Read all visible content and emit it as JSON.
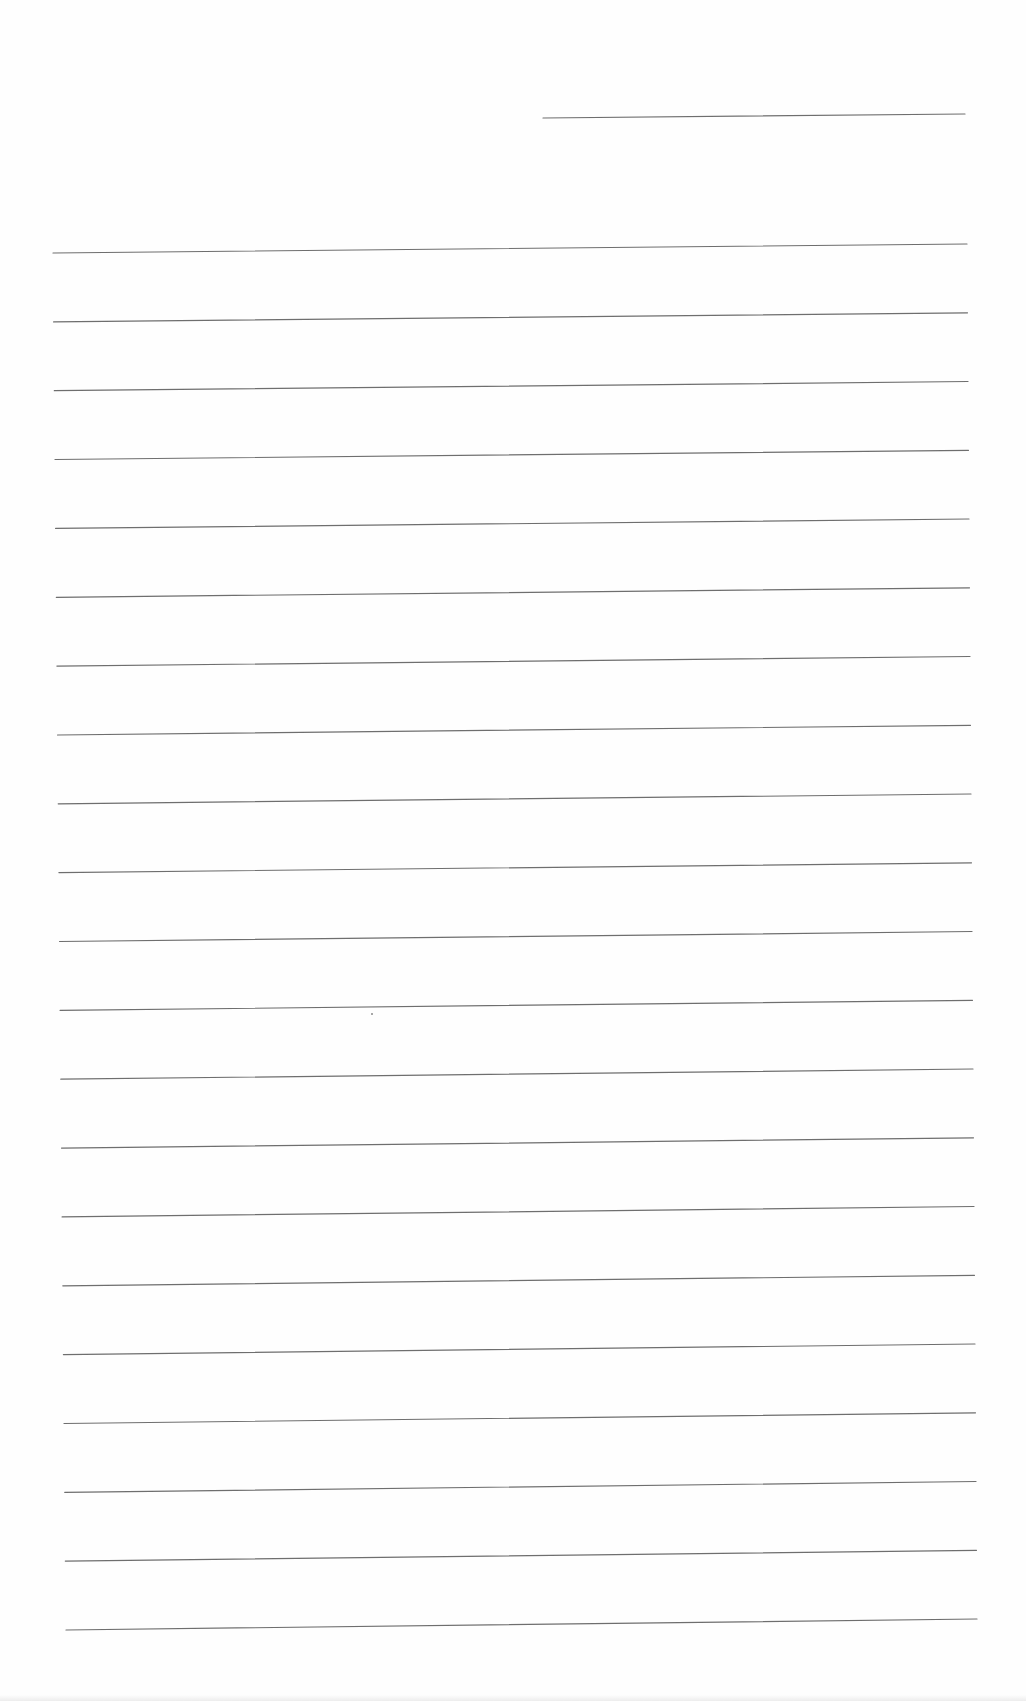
{
  "document": {
    "type": "blank-ruled-sheet",
    "background_color": "#fefefe",
    "line_color": "#6e6e6e",
    "line_width": 1.2,
    "header_line": {
      "x1": 543,
      "y1": 118,
      "x2": 965,
      "y2": 114
    },
    "ruled_lines": {
      "count": 21,
      "first": {
        "x1": 53,
        "y1": 253,
        "x2": 967,
        "y2": 244
      },
      "last": {
        "x1": 66,
        "y1": 1630,
        "x2": 977,
        "y2": 1619
      }
    },
    "specks": [
      {
        "x": 371,
        "y": 1013
      }
    ]
  }
}
